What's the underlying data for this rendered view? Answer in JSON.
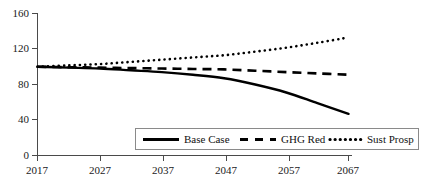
{
  "chart_data": {
    "type": "line",
    "title": "",
    "xlabel": "",
    "ylabel": "",
    "xlim": [
      2017,
      2067
    ],
    "ylim": [
      0,
      160
    ],
    "grid": false,
    "legend_position": "bottom-center",
    "x": [
      2017,
      2022,
      2027,
      2032,
      2037,
      2042,
      2047,
      2052,
      2057,
      2062,
      2067
    ],
    "xticks": [
      "2017",
      "2027",
      "2037",
      "2047",
      "2057",
      "2067"
    ],
    "yticks": [
      "0",
      "40",
      "80",
      "120",
      "160"
    ],
    "series": [
      {
        "name": "Base Case",
        "style": "solid",
        "values": [
          100,
          99,
          98,
          96,
          94,
          91,
          87,
          80,
          71,
          59,
          47
        ]
      },
      {
        "name": "GHG Red",
        "style": "dashed",
        "values": [
          100,
          99.5,
          99,
          98.5,
          98,
          97.5,
          97,
          95.5,
          94,
          92.5,
          91
        ]
      },
      {
        "name": "Sust Prosp",
        "style": "dotted",
        "values": [
          100,
          101.5,
          103,
          105.5,
          108,
          110.5,
          113,
          117,
          121.5,
          127,
          133
        ]
      }
    ]
  },
  "axes": {
    "y_tick_labels": [
      "160",
      "120",
      "80",
      "40",
      "0"
    ],
    "x_tick_labels": [
      "2017",
      "2027",
      "2037",
      "2047",
      "2057",
      "2067"
    ]
  },
  "legend": {
    "items": [
      {
        "label": "Base Case",
        "style": "solid"
      },
      {
        "label": "GHG Red",
        "style": "dashed"
      },
      {
        "label": "Sust Prosp",
        "style": "dotted"
      }
    ]
  },
  "colors": {
    "series": "#000000",
    "axis": "#4a4a4a",
    "text": "#111111",
    "background": "#ffffff",
    "legend_border": "#8a8a8a"
  }
}
